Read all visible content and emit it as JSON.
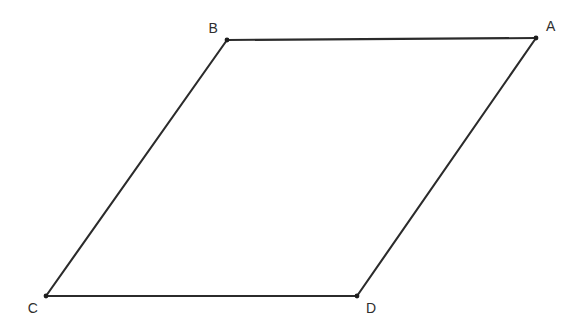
{
  "canvas": {
    "width": 580,
    "height": 334,
    "background_color": "#ffffff"
  },
  "figure": {
    "name": "parallelogram-abcd",
    "stroke_color": "#2b2b2b",
    "stroke_width": 2.1,
    "vertex_dot_color": "#1d1d1d",
    "vertex_dot_radius": 2.4,
    "label_color": "#2e2e2e",
    "label_font_size": 14
  },
  "vertices": [
    {
      "id": "A",
      "label": "A",
      "x": 536,
      "y": 38,
      "label_x": 546,
      "label_y": 31,
      "label_anchor": "start"
    },
    {
      "id": "B",
      "label": "B",
      "x": 227,
      "y": 40,
      "label_x": 218,
      "label_y": 33,
      "label_anchor": "end"
    },
    {
      "id": "C",
      "label": "C",
      "x": 46,
      "y": 296,
      "label_x": 38,
      "label_y": 313,
      "label_anchor": "end"
    },
    {
      "id": "D",
      "label": "D",
      "x": 357,
      "y": 296,
      "label_x": 366,
      "label_y": 313,
      "label_anchor": "start"
    }
  ],
  "edges": [
    {
      "id": "BA",
      "from": "B",
      "to": "A",
      "x1": 227,
      "y1": 40,
      "x2": 536,
      "y2": 38
    },
    {
      "id": "AD",
      "from": "A",
      "to": "D",
      "x1": 536,
      "y1": 38,
      "x2": 357,
      "y2": 296
    },
    {
      "id": "DC",
      "from": "D",
      "to": "C",
      "x1": 357,
      "y1": 296,
      "x2": 46,
      "y2": 296
    },
    {
      "id": "CB",
      "from": "C",
      "to": "B",
      "x1": 46,
      "y1": 296,
      "x2": 227,
      "y2": 40
    }
  ],
  "watermark": {
    "text": ""
  },
  "chart_data": {
    "type": "diagram",
    "title": "",
    "shape": "parallelogram",
    "vertex_order": [
      "B",
      "A",
      "D",
      "C"
    ],
    "points": {
      "A": [
        536,
        38
      ],
      "B": [
        227,
        40
      ],
      "C": [
        46,
        296
      ],
      "D": [
        357,
        296
      ]
    },
    "edges": [
      [
        "B",
        "A"
      ],
      [
        "A",
        "D"
      ],
      [
        "D",
        "C"
      ],
      [
        "C",
        "B"
      ]
    ],
    "parallel_pairs": [
      [
        "BA",
        "CD"
      ],
      [
        "BC",
        "AD"
      ]
    ],
    "grid": false,
    "legend": "none",
    "xlabel": "",
    "ylabel": ""
  }
}
